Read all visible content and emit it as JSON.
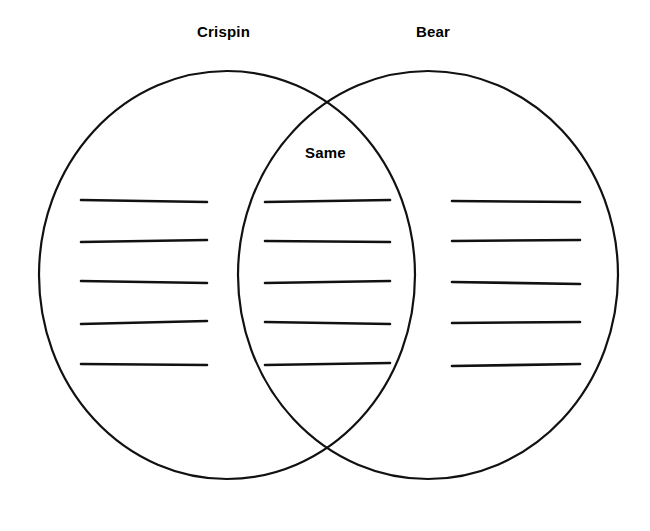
{
  "page": {
    "background_color": "#ffffff",
    "ink_color": "#111111",
    "width": 650,
    "height": 531
  },
  "diagram": {
    "type": "venn-2-circle",
    "left_label": "Crispin",
    "right_label": "Bear",
    "center_label": "Same",
    "circles": [
      {
        "name": "left-circle",
        "label": "Crispin",
        "cx": 227,
        "cy": 275,
        "rx": 188,
        "ry": 204
      },
      {
        "name": "right-circle",
        "label": "Bear",
        "cx": 428,
        "cy": 275,
        "rx": 190,
        "ry": 204
      }
    ],
    "line_rows_y": [
      200,
      241,
      282,
      323,
      364
    ],
    "line_groups": [
      {
        "name": "left-writing-lines",
        "region": "Crispin",
        "count": 5,
        "x_start": 81,
        "x_end": 207
      },
      {
        "name": "center-writing-lines",
        "region": "Same",
        "count": 5,
        "x_start": 265,
        "x_end": 390
      },
      {
        "name": "right-writing-lines",
        "region": "Bear",
        "count": 5,
        "x_start": 452,
        "x_end": 580
      }
    ]
  }
}
